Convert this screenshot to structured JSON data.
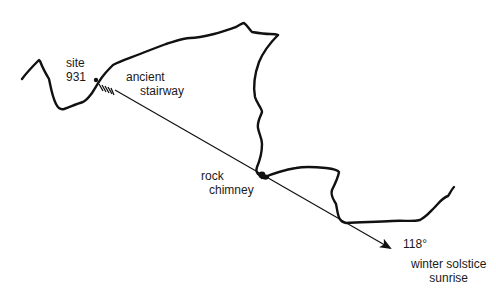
{
  "diagram": {
    "type": "alignment sketch",
    "colors": {
      "ink": "#111111",
      "background": "#ffffff"
    },
    "labels": {
      "site_line1": "site",
      "site_line2": "931",
      "stairway_line1": "ancient",
      "stairway_line2": "stairway",
      "chimney_line1": "rock",
      "chimney_line2": "chimney",
      "bearing": "118°",
      "target_line1": "winter solstice",
      "target_line2": "sunrise"
    },
    "features": [
      {
        "name": "site 931",
        "marker": "dot"
      },
      {
        "name": "ancient stairway",
        "marker": "hatch-marks"
      },
      {
        "name": "rock chimney",
        "marker": "dot"
      },
      {
        "name": "sight line",
        "marker": "arrow",
        "bearing": "118°"
      }
    ]
  }
}
